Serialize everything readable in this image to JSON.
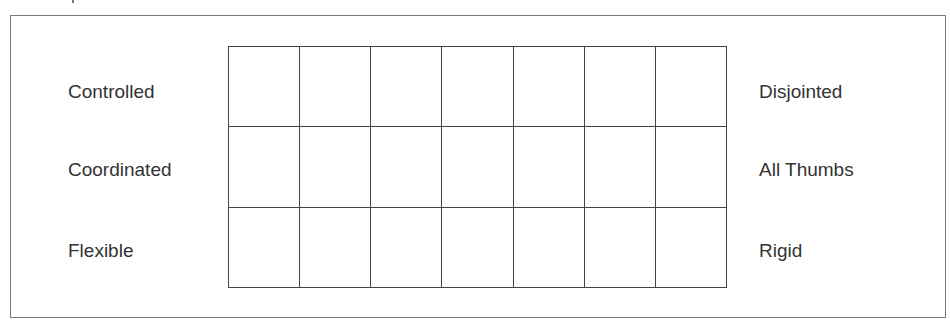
{
  "scale": {
    "rows": [
      {
        "left_label": "Controlled",
        "right_label": "Disjointed"
      },
      {
        "left_label": "Coordinated",
        "right_label": "All Thumbs"
      },
      {
        "left_label": "Flexible",
        "right_label": "Rigid"
      }
    ],
    "column_count": 7,
    "row_count": 3
  },
  "colors": {
    "grid_line": "#444444",
    "frame_border": "#7a7a7a",
    "text": "#333333",
    "background": "#ffffff"
  }
}
